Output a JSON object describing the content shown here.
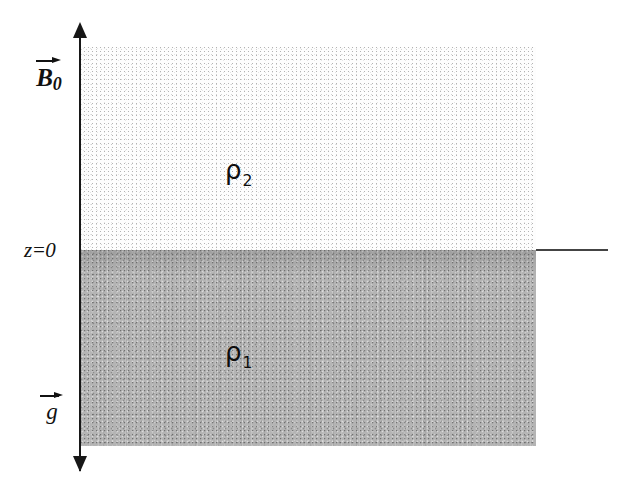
{
  "figure": {
    "width": 633,
    "height": 502,
    "background_color": "#ffffff"
  },
  "axis": {
    "name": "z-axis",
    "orientation": "vertical",
    "double_headed": true,
    "color": "#171717",
    "x_position": 80,
    "top": 22,
    "bottom": 472
  },
  "interface": {
    "label": "z=0",
    "y_position": 250,
    "line_color": "#444444",
    "line_start_x": 536,
    "line_end_x": 608
  },
  "regions": [
    {
      "name": "upper-fluid",
      "density_symbol": "ρ",
      "density_subscript": "2",
      "label": "ρ2",
      "fill": "light-stipple",
      "fill_color": "#fdfdfd",
      "top": 47,
      "bottom": 250,
      "left": 80,
      "right": 536
    },
    {
      "name": "lower-fluid",
      "density_symbol": "ρ",
      "density_subscript": "1",
      "label": "ρ1",
      "fill": "dark-stipple",
      "fill_color": "#b4b4b4",
      "top": 250,
      "bottom": 446,
      "left": 80,
      "right": 536
    }
  ],
  "vectors": [
    {
      "name": "magnetic-field",
      "symbol": "B",
      "subscript": "0",
      "label": "B0",
      "arrow_direction": "right",
      "position": "upper-left"
    },
    {
      "name": "gravity",
      "symbol": "g",
      "subscript": "",
      "label": "g",
      "arrow_direction": "right",
      "position": "lower-left"
    }
  ],
  "labels": {
    "magnetic_field_letter": "B",
    "magnetic_field_subscript": "0",
    "gravity_letter": "g",
    "interface_label": "z=0",
    "rho_symbol": "ρ",
    "rho_upper_subscript": "2",
    "rho_lower_subscript": "1"
  },
  "colors": {
    "ink": "#111111",
    "axis": "#171717",
    "interface_line": "#444444",
    "upper_fill": "#fdfdfd",
    "lower_fill": "#b4b4b4",
    "page": "#ffffff"
  }
}
